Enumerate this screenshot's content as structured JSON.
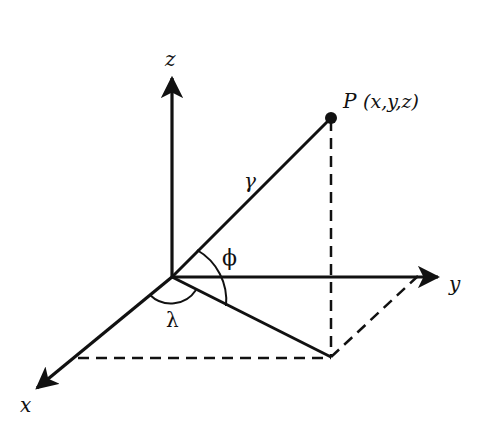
{
  "diagram": {
    "axes": {
      "x": {
        "label": "x"
      },
      "y": {
        "label": "y"
      },
      "z": {
        "label": "z"
      }
    },
    "point": {
      "name": "P",
      "coords_label": "(x,y,z)"
    },
    "angles": {
      "radius": "γ",
      "elevation": "ϕ",
      "azimuth": "λ"
    },
    "colors": {
      "stroke": "#111111",
      "background": "#ffffff"
    }
  }
}
